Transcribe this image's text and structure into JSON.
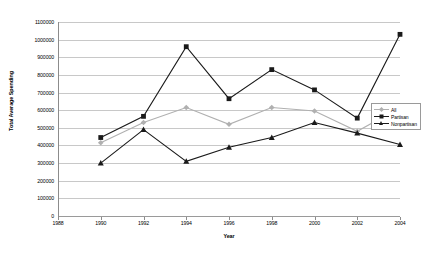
{
  "chart_data": {
    "type": "line",
    "title": "",
    "xlabel": "Year",
    "ylabel": "Total Average Spending",
    "x": [
      1988,
      1990,
      1992,
      1994,
      1996,
      1998,
      2000,
      2002,
      2004
    ],
    "xtick_labels": [
      "1988",
      "1990",
      "1992",
      "1994",
      "1996",
      "1998",
      "2000",
      "2002",
      "2004"
    ],
    "xlim": [
      1988,
      2004
    ],
    "ylim": [
      0,
      1100000
    ],
    "ytick_labels": [
      "0",
      "100000",
      "200000",
      "300000",
      "400000",
      "500000",
      "600000",
      "700000",
      "800000",
      "900000",
      "1000000",
      "1100000"
    ],
    "ytick_values": [
      0,
      100000,
      200000,
      300000,
      400000,
      500000,
      600000,
      700000,
      800000,
      900000,
      1000000,
      1100000
    ],
    "grid": true,
    "legend_position": "right",
    "series": [
      {
        "name": "All",
        "color": "#b0b0b0",
        "marker": "diamond",
        "x": [
          1990,
          1992,
          1994,
          1996,
          1998,
          2000,
          2002,
          2004
        ],
        "values": [
          415000,
          530000,
          615000,
          520000,
          615000,
          595000,
          480000,
          615000
        ]
      },
      {
        "name": "Partisan",
        "color": "#1a1a1a",
        "marker": "square",
        "x": [
          1990,
          1992,
          1994,
          1996,
          1998,
          2000,
          2002,
          2004
        ],
        "values": [
          445000,
          565000,
          960000,
          665000,
          830000,
          715000,
          555000,
          1030000
        ]
      },
      {
        "name": "Nonpartisan",
        "color": "#1a1a1a",
        "marker": "triangle",
        "x": [
          1990,
          1992,
          1994,
          1996,
          1998,
          2000,
          2002,
          2004
        ],
        "values": [
          300000,
          490000,
          310000,
          390000,
          445000,
          530000,
          470000,
          405000
        ]
      }
    ]
  },
  "legend": {
    "entries": [
      {
        "label": "All"
      },
      {
        "label": "Partisan"
      },
      {
        "label": "Nonpartisan"
      }
    ]
  },
  "axes": {
    "x_title": "Year",
    "y_title": "Total Average Spending"
  }
}
